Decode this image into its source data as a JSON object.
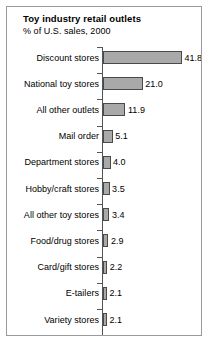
{
  "figure": {
    "title": "Toy industry retail outlets",
    "subtitle": "% of U.S. sales, 2000",
    "border_color": "#9a9a9a",
    "background_color": "#ffffff"
  },
  "chart_data": {
    "type": "bar",
    "orientation": "horizontal",
    "title": "Toy industry retail outlets",
    "subtitle": "% of U.S. sales, 2000",
    "xlabel": "",
    "ylabel": "",
    "xlim": [
      0,
      41.8
    ],
    "grid": false,
    "legend": false,
    "value_labels_shown": true,
    "bar_fill_color": "#a9a9a9",
    "bar_edge_color": "#4a4a4a",
    "axis_color": "#555555",
    "categories": [
      "Discount stores",
      "National toy stores",
      "All other outlets",
      "Mail order",
      "Department stores",
      "Hobby/craft stores",
      "All other toy stores",
      "Food/drug stores",
      "Card/gift stores",
      "E-tailers",
      "Variety stores"
    ],
    "values": [
      41.8,
      21.0,
      11.9,
      5.1,
      4.0,
      3.5,
      3.4,
      2.9,
      2.2,
      2.1,
      2.1
    ],
    "value_labels": [
      "41.8",
      "21.0",
      "11.9",
      "5.1",
      "4.0",
      "3.5",
      "3.4",
      "2.9",
      "2.2",
      "2.1",
      "2.1"
    ]
  }
}
